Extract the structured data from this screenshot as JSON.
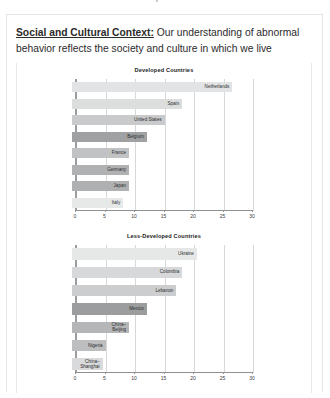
{
  "page": {
    "cut_off_heading": "Perspectives"
  },
  "lead": {
    "term": "Social and Cultural Context:",
    "text": " Our understanding of abnormal behavior reflects the society and culture in which we live"
  },
  "colors": {
    "page_background": "#ffffff",
    "card_border": "#e3e4e6",
    "text": "#231f20",
    "axis": "#9a9c9e",
    "gridline": "#d7d8da"
  },
  "chart_data": [
    {
      "type": "bar",
      "orientation": "horizontal",
      "title": "Developed Countries",
      "xlabel": "",
      "ylabel": "",
      "xlim": [
        0,
        30
      ],
      "xticks": [
        0,
        5,
        10,
        15,
        20,
        25,
        30
      ],
      "grid": true,
      "legend": "none",
      "categories": [
        "Netherlands",
        "Spain",
        "United States",
        "Belgium",
        "France",
        "Germany",
        "Japan",
        "Italy"
      ],
      "values": [
        26.5,
        18.0,
        15.0,
        12.0,
        9.0,
        9.0,
        9.0,
        8.0
      ],
      "bar_colors": [
        "#e2e3e4",
        "#dcdddd",
        "#c9cacb",
        "#9fa1a2",
        "#c1c2c3",
        "#b0b1b2",
        "#afb0b1",
        "#e7e8e8"
      ]
    },
    {
      "type": "bar",
      "orientation": "horizontal",
      "title": "Less-Developed Countries",
      "xlabel": "",
      "ylabel": "",
      "xlim": [
        0,
        30
      ],
      "xticks": [
        0,
        5,
        10,
        15,
        20,
        25,
        30
      ],
      "grid": true,
      "legend": "none",
      "categories": [
        "Ukraine",
        "Colombia",
        "Lebanon",
        "Mexico",
        "China–Beijing",
        "Nigeria",
        "China–Shanghai"
      ],
      "values": [
        20.5,
        18.0,
        17.0,
        12.0,
        9.0,
        5.0,
        4.5
      ],
      "bar_colors": [
        "#e6e7e7",
        "#d7d8d9",
        "#cccdce",
        "#9b9d9e",
        "#b5b6b7",
        "#bdbebf",
        "#d9dadb"
      ]
    }
  ]
}
